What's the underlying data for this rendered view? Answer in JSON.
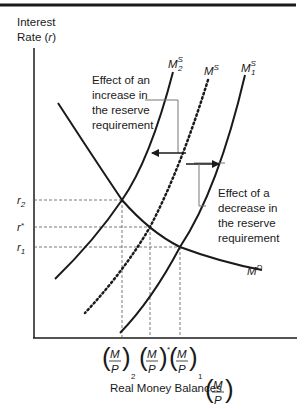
{
  "diagram": {
    "y_axis_label_line1": "Interest",
    "y_axis_label_line2": "Rate (",
    "y_axis_label_var": "r",
    "y_axis_label_close": ")",
    "x_axis_label": "Real Money Balances",
    "x_axis_frac_num": "M",
    "x_axis_frac_den": "P",
    "y_ticks": [
      {
        "base": "r",
        "sub": "2"
      },
      {
        "base": "r",
        "sup": "*"
      },
      {
        "base": "r",
        "sub": "1"
      }
    ],
    "x_ticks": [
      {
        "num": "M",
        "den": "P",
        "sub": "2"
      },
      {
        "num": "M",
        "den": "P",
        "sup": "*"
      },
      {
        "num": "M",
        "den": "P",
        "sub": "1"
      }
    ],
    "curves": {
      "ms2": {
        "base": "M",
        "sup": "S",
        "sub": "2"
      },
      "ms": {
        "base": "M",
        "sup": "S"
      },
      "ms1": {
        "base": "M",
        "sup": "S",
        "sub": "1"
      },
      "md": {
        "base": "M",
        "sup": "D"
      }
    },
    "annotations": {
      "increase": [
        "Effect of an",
        "increase in",
        "the reserve",
        "requirement"
      ],
      "decrease": [
        "Effect of a",
        "decrease in",
        "the reserve",
        "requirement"
      ]
    }
  }
}
